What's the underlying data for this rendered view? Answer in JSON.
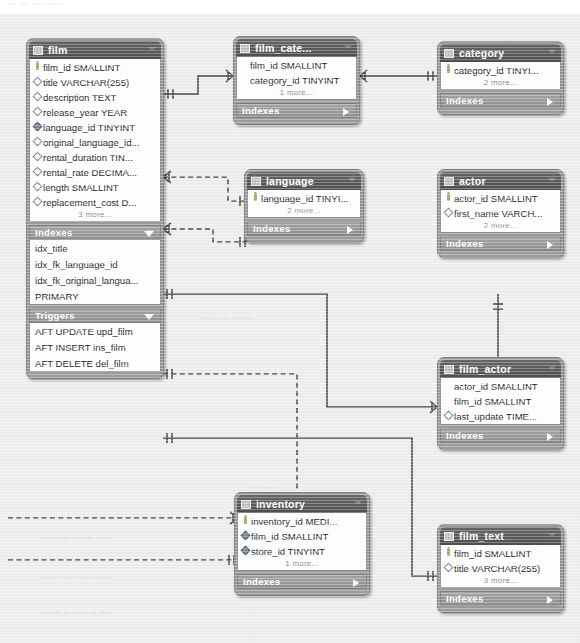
{
  "ghost_header": "•••  •••   ••••••••••",
  "canvas": {
    "background": "#eeeeee",
    "line_color": "#4a4a4a",
    "title_bar_color": "#565656",
    "band_color": "#9a9a9a",
    "box_frame_color": "#9d9d9d"
  },
  "labels": {
    "indexes": "Indexes",
    "triggers": "Triggers"
  },
  "tables": [
    {
      "id": "film",
      "name": "film",
      "columns": [
        {
          "key": "key",
          "text": "film_id SMALLINT"
        },
        {
          "key": "dia",
          "text": "title VARCHAR(255)"
        },
        {
          "key": "dia",
          "text": "description TEXT"
        },
        {
          "key": "dia",
          "text": "release_year YEAR"
        },
        {
          "key": "fdia",
          "text": "language_id TINYINT"
        },
        {
          "key": "dia",
          "text": "original_language_id..."
        },
        {
          "key": "dia",
          "text": "rental_duration TIN..."
        },
        {
          "key": "dia",
          "text": "rental_rate DECIMA..."
        },
        {
          "key": "dia",
          "text": "length SMALLINT"
        },
        {
          "key": "dia",
          "text": "replacement_cost D..."
        }
      ],
      "more": "3 more...",
      "sections": [
        {
          "band": "Indexes",
          "arrow": "down",
          "rows": [
            "idx_title",
            "idx_fk_language_id",
            "idx_fk_original_langua...",
            "PRIMARY"
          ]
        },
        {
          "band": "Triggers",
          "arrow": "down",
          "rows": [
            "AFT UPDATE upd_film",
            "AFT INSERT ins_film",
            "AFT DELETE del_film"
          ]
        }
      ]
    },
    {
      "id": "film_category",
      "name": "film_cate...",
      "columns": [
        {
          "key": "none",
          "text": "film_id SMALLINT"
        },
        {
          "key": "none",
          "text": "category_id TINYINT"
        }
      ],
      "more": "1 more...",
      "sections": [
        {
          "band": "Indexes",
          "arrow": "right",
          "rows": []
        }
      ]
    },
    {
      "id": "category",
      "name": "category",
      "columns": [
        {
          "key": "key",
          "text": "category_id TINYI..."
        }
      ],
      "more": "2 more...",
      "sections": [
        {
          "band": "Indexes",
          "arrow": "right",
          "rows": []
        }
      ]
    },
    {
      "id": "language",
      "name": "language",
      "columns": [
        {
          "key": "key",
          "text": "language_id TINYI..."
        }
      ],
      "more": "2 more...",
      "sections": [
        {
          "band": "Indexes",
          "arrow": "right",
          "rows": []
        }
      ]
    },
    {
      "id": "actor",
      "name": "actor",
      "columns": [
        {
          "key": "key",
          "text": "actor_id SMALLINT"
        },
        {
          "key": "dia",
          "text": "first_name VARCH..."
        }
      ],
      "more": "2 more...",
      "sections": [
        {
          "band": "Indexes",
          "arrow": "right",
          "rows": []
        }
      ]
    },
    {
      "id": "film_actor",
      "name": "film_actor",
      "columns": [
        {
          "key": "none",
          "text": "actor_id SMALLINT"
        },
        {
          "key": "none",
          "text": "film_id SMALLINT"
        },
        {
          "key": "dia",
          "text": "last_update TIME..."
        }
      ],
      "more": "",
      "sections": [
        {
          "band": "Indexes",
          "arrow": "right",
          "rows": []
        }
      ]
    },
    {
      "id": "inventory",
      "name": "inventory",
      "columns": [
        {
          "key": "key",
          "text": "inventory_id MEDI..."
        },
        {
          "key": "fdia",
          "text": "film_id SMALLINT"
        },
        {
          "key": "fdia",
          "text": "store_id TINYINT"
        }
      ],
      "more": "1 more...",
      "sections": [
        {
          "band": "Indexes",
          "arrow": "right",
          "rows": []
        }
      ]
    },
    {
      "id": "film_text",
      "name": "film_text",
      "columns": [
        {
          "key": "key",
          "text": "film_id SMALLINT"
        },
        {
          "key": "dia",
          "text": "title VARCHAR(255)"
        }
      ],
      "more": "3 more...",
      "sections": [
        {
          "band": "Indexes",
          "arrow": "right",
          "rows": []
        }
      ]
    }
  ],
  "relationships": [
    {
      "from": "film",
      "to": "film_category",
      "style": "solid"
    },
    {
      "from": "film_category",
      "to": "category",
      "style": "solid"
    },
    {
      "from": "film",
      "to": "language",
      "style": "dashed"
    },
    {
      "from": "film",
      "to": "language",
      "style": "dashed"
    },
    {
      "from": "film",
      "to": "film_actor",
      "style": "solid"
    },
    {
      "from": "actor",
      "to": "film_actor",
      "style": "solid"
    },
    {
      "from": "film",
      "to": "inventory",
      "style": "dashed"
    },
    {
      "from": "film",
      "to": "film_text",
      "style": "solid"
    },
    {
      "from": "inventory",
      "to": "left-offscreen",
      "style": "dashed"
    },
    {
      "from": "inventory",
      "to": "left-offscreen",
      "style": "dashed"
    }
  ],
  "ghost_text": [
    {
      "x": 200,
      "y": 300,
      "t": "•••••• ••• •••••••"
    },
    {
      "x": 40,
      "y": 520,
      "t": "••••• •••• ••••••• •• ••"
    },
    {
      "x": 40,
      "y": 560,
      "t": "•••••• ••••• ••• •••••••"
    },
    {
      "x": 40,
      "y": 595,
      "t": "••••••• •• ••••• •• ••••"
    },
    {
      "x": 250,
      "y": 470,
      "t": "••• ••••"
    }
  ]
}
